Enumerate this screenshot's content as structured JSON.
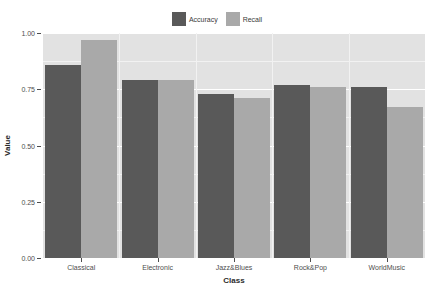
{
  "chart_data": {
    "type": "bar",
    "title": "",
    "xlabel": "Class",
    "ylabel": "Value",
    "categories": [
      "Classical",
      "Electronic",
      "Jazz&Blues",
      "Rock&Pop",
      "WorldMusic"
    ],
    "series": [
      {
        "name": "Accuracy",
        "color": "#595959",
        "values": [
          0.86,
          0.79,
          0.73,
          0.77,
          0.76
        ]
      },
      {
        "name": "Recall",
        "color": "#a9a9a9",
        "values": [
          0.97,
          0.79,
          0.71,
          0.76,
          0.67
        ]
      }
    ],
    "ylim": [
      0.0,
      1.0
    ],
    "yticks": [
      "0.00",
      "0.25",
      "0.50",
      "0.75",
      "1.00"
    ],
    "ytick_values": [
      0.0,
      0.25,
      0.5,
      0.75,
      1.0
    ],
    "grid": true,
    "legend_position": "top",
    "panel_background": "#e2e2e2",
    "gridline_color": "#ffffff"
  },
  "legend": {
    "entries": [
      {
        "label": "Accuracy"
      },
      {
        "label": "Recall"
      }
    ]
  },
  "axes": {
    "y_title": "Value",
    "x_title": "Class"
  }
}
